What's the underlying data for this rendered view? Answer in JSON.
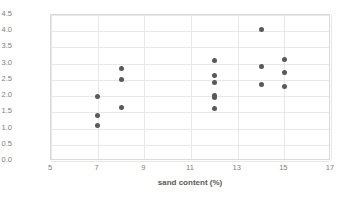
{
  "chart_data": {
    "type": "scatter",
    "title": "",
    "xlabel": "sand content (%)",
    "ylabel": "UCS (MPa)",
    "xlim": [
      5,
      17
    ],
    "ylim": [
      0.0,
      4.5
    ],
    "xticks": [
      "5",
      "7",
      "9",
      "11",
      "13",
      "15",
      "17"
    ],
    "xtick_values": [
      5,
      7,
      9,
      11,
      13,
      15,
      17
    ],
    "yticks": [
      "0.0",
      "0.5",
      "1.0",
      "1.5",
      "2.0",
      "2.5",
      "3.0",
      "3.5",
      "4.0",
      "4.5"
    ],
    "ytick_values": [
      0.0,
      0.5,
      1.0,
      1.5,
      2.0,
      2.5,
      3.0,
      3.5,
      4.0,
      4.5
    ],
    "grid": true,
    "legend": false,
    "marker_color": "#595959",
    "series": [
      {
        "name": "UCS vs sand content",
        "points": [
          {
            "x": 7,
            "y": 1.08
          },
          {
            "x": 7,
            "y": 1.39
          },
          {
            "x": 7,
            "y": 1.98
          },
          {
            "x": 8,
            "y": 1.65
          },
          {
            "x": 8,
            "y": 2.51
          },
          {
            "x": 8,
            "y": 2.84
          },
          {
            "x": 12,
            "y": 1.61
          },
          {
            "x": 12,
            "y": 1.96
          },
          {
            "x": 12,
            "y": 2.02
          },
          {
            "x": 12,
            "y": 2.43
          },
          {
            "x": 12,
            "y": 2.64
          },
          {
            "x": 12,
            "y": 3.11
          },
          {
            "x": 14,
            "y": 2.37
          },
          {
            "x": 14,
            "y": 2.92
          },
          {
            "x": 14,
            "y": 4.04
          },
          {
            "x": 15,
            "y": 2.29
          },
          {
            "x": 15,
            "y": 2.74
          },
          {
            "x": 15,
            "y": 3.14
          }
        ]
      }
    ]
  }
}
